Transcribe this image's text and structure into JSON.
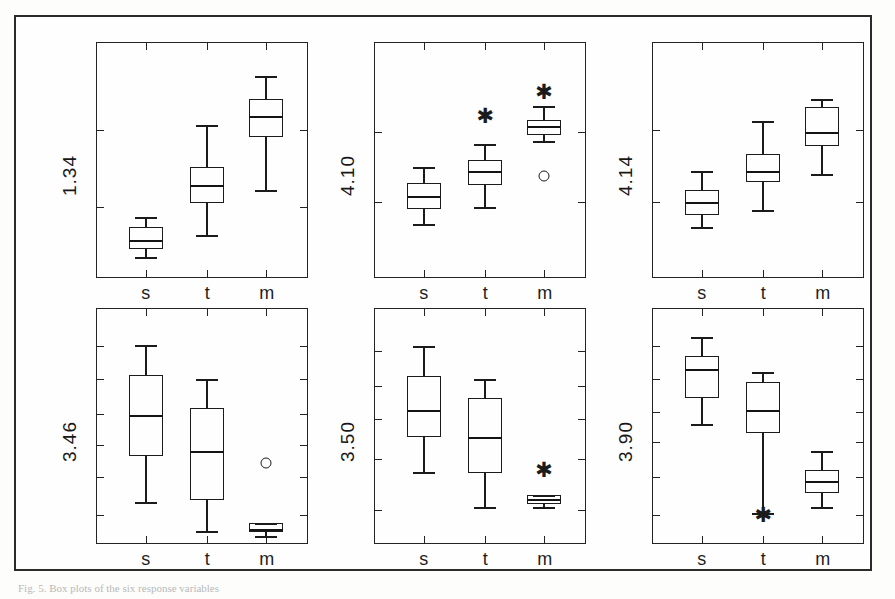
{
  "figure": {
    "caption_fragment": "Fig. 5. Box plots of the six response variables",
    "frame_color": "#2b2b2b",
    "ink_color": "#1b1b1b",
    "background_color": "#fefefe"
  },
  "chart_data": {
    "type": "box",
    "title": "",
    "xlabel": "",
    "ylabel": "",
    "grid": false,
    "legend": "none",
    "categories": [
      "s",
      "t",
      "m"
    ],
    "panel_layout": {
      "rows": 2,
      "cols": 3
    },
    "panels": [
      {
        "id": "panel-1",
        "ylabel": "1.34",
        "y_axis_ticks_left": [
          0.3,
          0.63
        ],
        "x_axis_ticks": [
          "s",
          "t",
          "m"
        ],
        "boxes": [
          {
            "category": "s",
            "whisker_low": 0.085,
            "q1": 0.12,
            "median": 0.16,
            "q3": 0.215,
            "whisker_high": 0.255,
            "outliers_circle": [],
            "outliers_star": []
          },
          {
            "category": "t",
            "whisker_low": 0.18,
            "q1": 0.315,
            "median": 0.395,
            "q3": 0.47,
            "whisker_high": 0.65,
            "outliers_circle": [],
            "outliers_star": []
          },
          {
            "category": "m",
            "whisker_low": 0.37,
            "q1": 0.6,
            "median": 0.69,
            "q3": 0.76,
            "whisker_high": 0.86,
            "outliers_circle": [],
            "outliers_star": []
          }
        ]
      },
      {
        "id": "panel-2",
        "ylabel": "4.10",
        "y_axis_ticks_left": [
          0.32,
          0.62
        ],
        "x_axis_ticks": [
          "s",
          "t",
          "m"
        ],
        "boxes": [
          {
            "category": "s",
            "whisker_low": 0.225,
            "q1": 0.29,
            "median": 0.345,
            "q3": 0.4,
            "whisker_high": 0.47,
            "outliers_circle": [],
            "outliers_star": []
          },
          {
            "category": "t",
            "whisker_low": 0.3,
            "q1": 0.395,
            "median": 0.455,
            "q3": 0.5,
            "whisker_high": 0.57,
            "outliers_circle": [],
            "outliers_star": [
              0.69
            ]
          },
          {
            "category": "m",
            "whisker_low": 0.58,
            "q1": 0.605,
            "median": 0.645,
            "q3": 0.672,
            "whisker_high": 0.73,
            "outliers_circle": [
              0.43
            ],
            "outliers_star": [
              0.79
            ]
          }
        ]
      },
      {
        "id": "panel-3",
        "ylabel": "4.14",
        "y_axis_ticks_left": [
          0.32,
          0.63
        ],
        "x_axis_ticks": [
          "s",
          "t",
          "m"
        ],
        "boxes": [
          {
            "category": "s",
            "whisker_low": 0.215,
            "q1": 0.265,
            "median": 0.32,
            "q3": 0.37,
            "whisker_high": 0.455,
            "outliers_circle": [],
            "outliers_star": []
          },
          {
            "category": "t",
            "whisker_low": 0.285,
            "q1": 0.405,
            "median": 0.455,
            "q3": 0.525,
            "whisker_high": 0.665,
            "outliers_circle": [],
            "outliers_star": []
          },
          {
            "category": "m",
            "whisker_low": 0.44,
            "q1": 0.56,
            "median": 0.62,
            "q3": 0.725,
            "whisker_high": 0.76,
            "outliers_circle": [],
            "outliers_star": []
          }
        ]
      },
      {
        "id": "panel-4",
        "ylabel": "3.46",
        "y_axis_ticks_left": [
          0.12,
          0.28,
          0.42,
          0.55,
          0.7,
          0.84
        ],
        "x_axis_ticks": [
          "s",
          "t",
          "m"
        ],
        "boxes": [
          {
            "category": "s",
            "whisker_low": 0.175,
            "q1": 0.37,
            "median": 0.545,
            "q3": 0.72,
            "whisker_high": 0.845,
            "outliers_circle": [],
            "outliers_star": []
          },
          {
            "category": "t",
            "whisker_low": 0.05,
            "q1": 0.185,
            "median": 0.395,
            "q3": 0.575,
            "whisker_high": 0.7,
            "outliers_circle": [],
            "outliers_star": []
          },
          {
            "category": "m",
            "whisker_low": 0.03,
            "q1": 0.045,
            "median": 0.06,
            "q3": 0.085,
            "whisker_high": 0.085,
            "outliers_circle": [
              0.34
            ],
            "outliers_star": []
          }
        ]
      },
      {
        "id": "panel-5",
        "ylabel": "3.50",
        "y_axis_ticks_left": [
          0.14,
          0.36,
          0.53,
          0.67,
          0.82
        ],
        "x_axis_ticks": [
          "s",
          "t",
          "m"
        ],
        "boxes": [
          {
            "category": "s",
            "whisker_low": 0.305,
            "q1": 0.455,
            "median": 0.57,
            "q3": 0.715,
            "whisker_high": 0.84,
            "outliers_circle": [],
            "outliers_star": []
          },
          {
            "category": "t",
            "whisker_low": 0.155,
            "q1": 0.3,
            "median": 0.455,
            "q3": 0.62,
            "whisker_high": 0.7,
            "outliers_circle": [],
            "outliers_star": []
          },
          {
            "category": "m",
            "whisker_low": 0.155,
            "q1": 0.165,
            "median": 0.19,
            "q3": 0.205,
            "whisker_high": 0.205,
            "outliers_circle": [],
            "outliers_star": [
              0.31
            ]
          }
        ]
      },
      {
        "id": "panel-6",
        "ylabel": "3.90",
        "y_axis_ticks_left": [
          0.12,
          0.28,
          0.43,
          0.56,
          0.7,
          0.84
        ],
        "x_axis_ticks": [
          "s",
          "t",
          "m"
        ],
        "boxes": [
          {
            "category": "s",
            "whisker_low": 0.51,
            "q1": 0.62,
            "median": 0.745,
            "q3": 0.8,
            "whisker_high": 0.88,
            "outliers_circle": [],
            "outliers_star": []
          },
          {
            "category": "t",
            "whisker_low": 0.13,
            "q1": 0.47,
            "median": 0.57,
            "q3": 0.69,
            "whisker_high": 0.73,
            "outliers_circle": [],
            "outliers_star": [
              0.12
            ]
          },
          {
            "category": "m",
            "whisker_low": 0.155,
            "q1": 0.215,
            "median": 0.265,
            "q3": 0.31,
            "whisker_high": 0.395,
            "outliers_circle": [],
            "outliers_star": []
          }
        ]
      }
    ]
  }
}
